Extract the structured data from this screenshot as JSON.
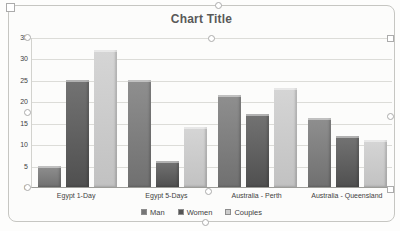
{
  "chart_data": {
    "type": "bar",
    "title": "Chart Title",
    "categories": [
      "Egypt 1-Day",
      "Egypt 5-Days",
      "Australia - Perth",
      "Australia - Queensland"
    ],
    "series": [
      {
        "name": "Man",
        "color": "#767676",
        "values": [
          5,
          25,
          21.5,
          16
        ]
      },
      {
        "name": "Women",
        "color": "#545454",
        "values": [
          25,
          6,
          17,
          12
        ]
      },
      {
        "name": "Couples",
        "color": "#cccccc",
        "values": [
          32,
          14,
          23,
          11
        ]
      }
    ],
    "xlabel": "",
    "ylabel": "",
    "ylim": [
      0,
      35
    ],
    "yticks": [
      0,
      5,
      10,
      15,
      20,
      25,
      30,
      35
    ],
    "grid": true,
    "legend_position": "bottom"
  },
  "colors": {
    "chart_background": "#fcfcfb",
    "frame_border": "#c6c6c2",
    "gridline": "#dcdcd8",
    "axis_line": "#9c9c98",
    "title_text": "#595959",
    "tick_label_text": "#3f3f3f"
  }
}
